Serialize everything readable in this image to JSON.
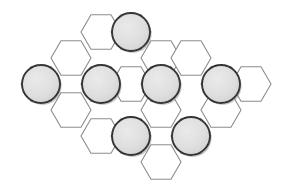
{
  "board": {
    "title": "Hexagonal board",
    "type": "hex-grid",
    "orientation": "flat-top",
    "hex_radius": 20,
    "columns": 7,
    "rows": 4,
    "colors": {
      "background": "#ffffff",
      "hex_fill": "#ffffff",
      "hex_stroke": "#8c8c8c",
      "piece_fill": "#e2e2e2",
      "piece_stroke": "#141414",
      "piece_shadow": "#9a9a9a"
    },
    "geometry": {
      "col_step": 30,
      "row_step": 52.5,
      "origin_x": 41,
      "origin_y": 84
    },
    "cells": [
      {
        "id": "c-0-0",
        "label": "a1",
        "x": 41,
        "y": 84,
        "occupied": true
      },
      {
        "id": "c-1-0",
        "label": "b1",
        "x": 71,
        "y": 58,
        "occupied": false
      },
      {
        "id": "c-1-1",
        "label": "b2",
        "x": 71,
        "y": 110,
        "occupied": false
      },
      {
        "id": "c-2-0",
        "label": "c1",
        "x": 101,
        "y": 32,
        "occupied": false
      },
      {
        "id": "c-2-1",
        "label": "c2",
        "x": 101,
        "y": 84,
        "occupied": true
      },
      {
        "id": "c-2-2",
        "label": "c3",
        "x": 101,
        "y": 136,
        "occupied": false
      },
      {
        "id": "c-3-0",
        "label": "d1",
        "x": 131,
        "y": 32,
        "occupied": true
      },
      {
        "id": "c-3-1",
        "label": "d2",
        "x": 131,
        "y": 84,
        "occupied": false
      },
      {
        "id": "c-3-2",
        "label": "d3",
        "x": 131,
        "y": 136,
        "occupied": true
      },
      {
        "id": "c-4-0",
        "label": "e1",
        "x": 161,
        "y": 58,
        "occupied": false
      },
      {
        "id": "c-4-1",
        "label": "e2",
        "x": 161,
        "y": 110,
        "occupied": false
      },
      {
        "id": "c-4-2",
        "label": "e3",
        "x": 161,
        "y": 162,
        "occupied": false
      },
      {
        "id": "c-4-3",
        "label": "e4",
        "x": 161,
        "y": 84,
        "occupied": true
      },
      {
        "id": "c-5-0",
        "label": "f1",
        "x": 191,
        "y": 58,
        "occupied": false
      },
      {
        "id": "c-5-1",
        "label": "f2",
        "x": 191,
        "y": 136,
        "occupied": true
      },
      {
        "id": "c-6-0",
        "label": "g1",
        "x": 221,
        "y": 84,
        "occupied": true
      },
      {
        "id": "c-6-1",
        "label": "g2",
        "x": 221,
        "y": 110,
        "occupied": false
      },
      {
        "id": "c-7-0",
        "label": "h1",
        "x": 251,
        "y": 84,
        "occupied": false
      }
    ],
    "pieces": [
      {
        "id": "p1",
        "cell": "d1",
        "x": 131,
        "y": 32,
        "radius": 19
      },
      {
        "id": "p2",
        "cell": "a1",
        "x": 41,
        "y": 84,
        "radius": 19
      },
      {
        "id": "p3",
        "cell": "c2",
        "x": 101,
        "y": 84,
        "radius": 19
      },
      {
        "id": "p4",
        "cell": "e4",
        "x": 161,
        "y": 84,
        "radius": 19
      },
      {
        "id": "p5",
        "cell": "g1",
        "x": 221,
        "y": 84,
        "radius": 19
      },
      {
        "id": "p6",
        "cell": "d3",
        "x": 131,
        "y": 136,
        "radius": 19
      },
      {
        "id": "p7",
        "cell": "f2",
        "x": 191,
        "y": 136,
        "radius": 19
      }
    ],
    "piece_count": 7,
    "cell_count": 18
  }
}
